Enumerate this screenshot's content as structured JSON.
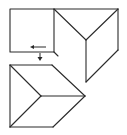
{
  "diagram": {
    "stroke_color": "#2a2a2a",
    "background_color": "#ffffff",
    "shapes": [
      {
        "name": "flat-square",
        "kind": "square"
      },
      {
        "name": "folded-prism",
        "kind": "prism-view"
      },
      {
        "name": "result-cube-view",
        "kind": "cube-corner-view"
      }
    ],
    "arrows": [
      {
        "name": "left-arrow",
        "direction": "left"
      },
      {
        "name": "down-arrow",
        "direction": "down"
      }
    ]
  }
}
